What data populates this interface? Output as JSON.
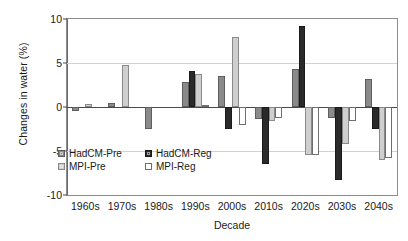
{
  "chart_data": {
    "type": "bar",
    "title": "",
    "xlabel": "Decade",
    "ylabel": "Changes in water (%)",
    "categories": [
      "1960s",
      "1970s",
      "1980s",
      "1990s",
      "2000s",
      "2010s",
      "2020s",
      "2030s",
      "2040s"
    ],
    "ylim": [
      -10,
      10
    ],
    "yticks": [
      10,
      5,
      0,
      -5,
      -10
    ],
    "ytick_labels": [
      "10",
      "5",
      "0",
      "-5",
      "-10"
    ],
    "grid": true,
    "legend_position": "inside-bottom-left",
    "series": [
      {
        "name": "HadCM-Pre",
        "color": "#8a8a8a",
        "values": [
          -0.4,
          0.5,
          -2.5,
          2.8,
          3.5,
          -1.4,
          4.3,
          -1.2,
          3.2
        ]
      },
      {
        "name": "HadCM-Reg",
        "color": "#2a2a2a",
        "values": [
          0.0,
          0.0,
          0.0,
          4.1,
          -2.5,
          -6.5,
          9.2,
          -8.3,
          -2.5
        ]
      },
      {
        "name": "MPI-Pre",
        "color": "#cfcfcf",
        "values": [
          0.3,
          4.8,
          0.0,
          3.7,
          8.0,
          -1.6,
          -5.5,
          -4.2,
          -6.0
        ]
      },
      {
        "name": "MPI-Reg",
        "color": "#ffffff",
        "values": [
          0.0,
          0.0,
          0.0,
          0.2,
          -2.0,
          -1.3,
          -5.5,
          -1.6,
          -5.8
        ]
      }
    ]
  },
  "legend": {
    "items": [
      {
        "label": "HadCM-Pre",
        "swatch": "swatch-hadcm-pre"
      },
      {
        "label": "HadCM-Reg",
        "swatch": "swatch-hadcm-reg"
      },
      {
        "label": "MPI-Pre",
        "swatch": "swatch-mpi-pre"
      },
      {
        "label": "MPI-Reg",
        "swatch": "swatch-mpi-reg"
      }
    ]
  }
}
